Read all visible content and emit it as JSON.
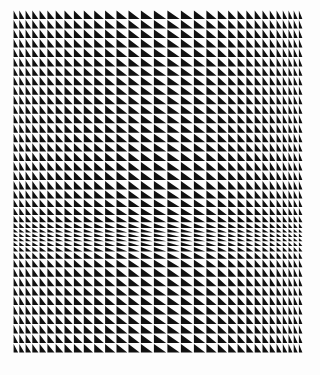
{
  "artwork": {
    "type": "op-art triangle grid",
    "colors": {
      "background": "#fdfdfd",
      "ink": "#111111"
    },
    "bounds": {
      "left": 13,
      "top": 10,
      "width": 290,
      "height": 343
    },
    "column_weights": [
      0.55,
      0.6,
      0.65,
      0.7,
      0.75,
      0.8,
      0.85,
      0.9,
      0.95,
      1,
      1.05,
      1.1,
      1.15,
      1.2,
      1.25,
      1.3,
      1.3,
      1.25,
      1.2,
      1.1,
      1.0,
      0.9,
      0.85,
      0.8,
      0.75,
      0.7,
      0.65,
      0.6,
      0.55,
      0.5,
      0.5,
      0.45
    ],
    "row_weights": [
      1,
      1,
      1,
      1,
      1,
      1,
      1,
      1,
      1,
      1,
      1,
      1,
      1,
      1,
      1,
      1,
      1,
      1,
      1,
      0.95,
      0.9,
      0.85,
      0.75,
      0.6,
      0.5,
      0.45,
      0.45,
      0.5,
      0.6,
      0.75,
      0.9,
      1,
      1,
      1,
      1,
      1,
      1,
      1,
      1,
      1
    ],
    "cell_fill": "lower-left triangle"
  }
}
